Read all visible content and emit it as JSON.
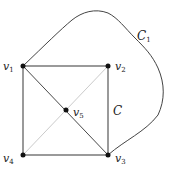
{
  "figure": {
    "type": "graph",
    "vertices": [
      {
        "id": "v1",
        "label": "v",
        "sub": "1",
        "x": 23,
        "y": 66,
        "lx": 3,
        "ly": 70
      },
      {
        "id": "v2",
        "label": "v",
        "sub": "2",
        "x": 108,
        "y": 66,
        "lx": 115,
        "ly": 70
      },
      {
        "id": "v3",
        "label": "v",
        "sub": "3",
        "x": 108,
        "y": 155,
        "lx": 115,
        "ly": 162
      },
      {
        "id": "v4",
        "label": "v",
        "sub": "4",
        "x": 23,
        "y": 155,
        "lx": 3,
        "ly": 162
      },
      {
        "id": "v5",
        "label": "v",
        "sub": "5",
        "x": 66,
        "y": 110,
        "lx": 73,
        "ly": 116
      }
    ],
    "edges": [
      {
        "from": "v1",
        "to": "v2",
        "style": "cycle-C"
      },
      {
        "from": "v2",
        "to": "v3",
        "style": "cycle-C"
      },
      {
        "from": "v3",
        "to": "v4",
        "style": "cycle-C"
      },
      {
        "from": "v4",
        "to": "v1",
        "style": "cycle-C"
      },
      {
        "from": "v1",
        "to": "v3",
        "style": "dark"
      },
      {
        "from": "v2",
        "to": "v4",
        "style": "light"
      }
    ],
    "curve": {
      "name": "C1",
      "label": "C",
      "sub": "1",
      "from": "v1",
      "to": "v3",
      "lx": 137,
      "ly": 40
    },
    "cycle_label": {
      "label": "C",
      "lx": 113,
      "ly": 115
    },
    "colors": {
      "cycle": "#9a9a9a",
      "dark": "#333333",
      "light": "#bdbdbd",
      "vertex": "#111111",
      "curve": "#444444"
    }
  }
}
